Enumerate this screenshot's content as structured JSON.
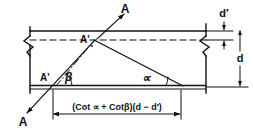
{
  "figure": {
    "type": "structural-engineering-section-diagram"
  },
  "labels": {
    "section_top": "A",
    "section_bottom": "A",
    "point_upper": "A'",
    "point_lower": "A'",
    "angle_alpha": "∝",
    "angle_beta": "β",
    "dim_d": "d",
    "dim_d_prime": "d′",
    "horizontal_dimension": "(Cot ∝ + Cotβ)(d − d′)"
  },
  "formula_parts": {
    "open_paren": "(",
    "cot_alpha": "Cot ∝",
    "plus": "+",
    "cot_beta": "Cotβ",
    "close_paren": ")",
    "d_minus_dprime": "(d − d′)"
  },
  "geometry": {
    "top_flange_y": 31,
    "centroid_dash_y": 40,
    "bottom_flange_y": 86,
    "bottom_flange_y2": 89,
    "left_edge_x": 30,
    "right_edge_x": 206,
    "upper_point": {
      "x": 94,
      "y": 40
    },
    "lower_point": {
      "x": 58,
      "y": 84
    },
    "alpha_vertex": {
      "x": 182,
      "y": 86
    },
    "dimension_line_y": 113,
    "dimension_left_x": 53,
    "dimension_right_x": 181,
    "d_dimension_x": 238,
    "dprime_dimension_x": 224
  },
  "colors": {
    "ink": "#111111",
    "background": "#ffffff"
  }
}
